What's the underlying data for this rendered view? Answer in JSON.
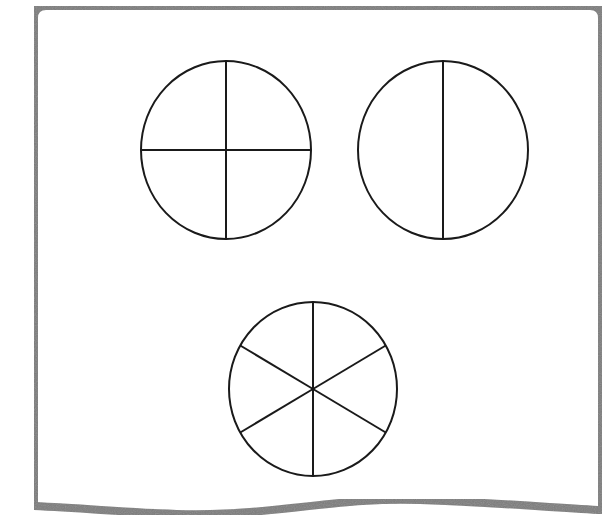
{
  "diagram": {
    "title": "Fraction circles divided into equal parts",
    "colors": {
      "frame": "#7a7a7a",
      "divider": "#7a7a7a",
      "circle_stroke": "#1a1a1a",
      "background": "#ffffff"
    },
    "frame": {
      "left": 34,
      "top": 6,
      "right": 602,
      "bottom_wave": "M34,506 C120,510 180,518 250,512 C320,506 360,498 420,500 C500,503 560,508 602,510"
    },
    "divider_line": {
      "x1": 0,
      "x2": 600,
      "y": 296
    },
    "circles": [
      {
        "id": "circle-quarters",
        "label": "Circle divided into 4 equal parts",
        "parts": 4,
        "cx": 226,
        "cy": 150,
        "rx": 85,
        "ry": 89,
        "spoke_angles_deg": [
          0,
          90,
          180,
          270
        ]
      },
      {
        "id": "circle-halves",
        "label": "Circle divided into 2 equal parts",
        "parts": 2,
        "cx": 443,
        "cy": 150,
        "rx": 85,
        "ry": 89,
        "spoke_angles_deg": [
          90,
          270
        ]
      },
      {
        "id": "circle-sixths",
        "label": "Circle divided into 6 equal parts",
        "parts": 6,
        "cx": 313,
        "cy": 389,
        "rx": 84,
        "ry": 87,
        "spoke_angles_deg": [
          90,
          150,
          210,
          270,
          330,
          30
        ]
      }
    ]
  }
}
